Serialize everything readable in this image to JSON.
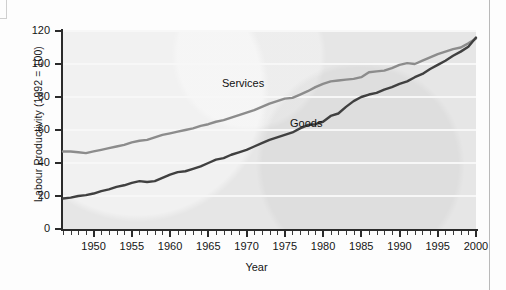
{
  "figure": {
    "ylabel": "Labour Productivity (1992 = 100)",
    "xlabel": "Year"
  },
  "chart_data": {
    "type": "line",
    "title": "",
    "xlabel": "Year",
    "ylabel": "Labour Productivity (1992 = 100)",
    "xlim": [
      1946,
      2000
    ],
    "ylim": [
      0,
      120
    ],
    "yticks": [
      0,
      20,
      40,
      60,
      80,
      100,
      120
    ],
    "xticks": [
      1950,
      1955,
      1960,
      1965,
      1970,
      1975,
      1980,
      1985,
      1990,
      1995,
      2000
    ],
    "xtick_interval_minor": 1,
    "grid": true,
    "legend": "inline-labels",
    "x": [
      1946,
      1947,
      1948,
      1949,
      1950,
      1951,
      1952,
      1953,
      1954,
      1955,
      1956,
      1957,
      1958,
      1959,
      1960,
      1961,
      1962,
      1963,
      1964,
      1965,
      1966,
      1967,
      1968,
      1969,
      1970,
      1971,
      1972,
      1973,
      1974,
      1975,
      1976,
      1977,
      1978,
      1979,
      1980,
      1981,
      1982,
      1983,
      1984,
      1985,
      1986,
      1987,
      1988,
      1989,
      1990,
      1991,
      1992,
      1993,
      1994,
      1995,
      1996,
      1997,
      1998,
      1999,
      2000
    ],
    "series": [
      {
        "name": "Services",
        "color": "#8c8c8c",
        "label_position": {
          "x": 1964,
          "y": 86
        },
        "values": [
          47,
          47,
          46.5,
          46,
          47,
          48,
          49,
          50,
          51,
          52.5,
          53.5,
          54,
          55.5,
          57,
          58,
          59,
          60,
          61,
          62.5,
          63.5,
          65,
          66,
          67.5,
          69,
          70.5,
          72,
          74,
          76,
          77.5,
          79,
          79.5,
          81.5,
          83.5,
          86,
          88,
          89.5,
          90,
          90.5,
          91,
          92,
          95,
          95.5,
          96,
          97.5,
          99.5,
          100.5,
          100,
          102,
          104,
          106,
          107.5,
          109,
          110,
          112.5,
          115.5
        ]
      },
      {
        "name": "Goods",
        "color": "#404040",
        "label_position": {
          "x": 1975,
          "y": 66
        },
        "values": [
          18.5,
          19,
          20,
          20.5,
          21.5,
          23,
          24,
          25.5,
          26.5,
          28,
          29,
          28.5,
          29,
          31,
          33,
          34.5,
          35,
          36.5,
          38,
          40,
          42,
          43,
          45,
          46.5,
          48,
          50,
          52,
          54,
          55.5,
          57,
          58.5,
          61,
          63,
          63.5,
          65,
          68.5,
          70,
          74,
          77.5,
          80,
          81.5,
          82.5,
          84.5,
          86,
          88,
          89.5,
          92,
          94,
          97,
          99.5,
          102,
          105,
          107.5,
          110.5,
          116
        ]
      }
    ]
  }
}
